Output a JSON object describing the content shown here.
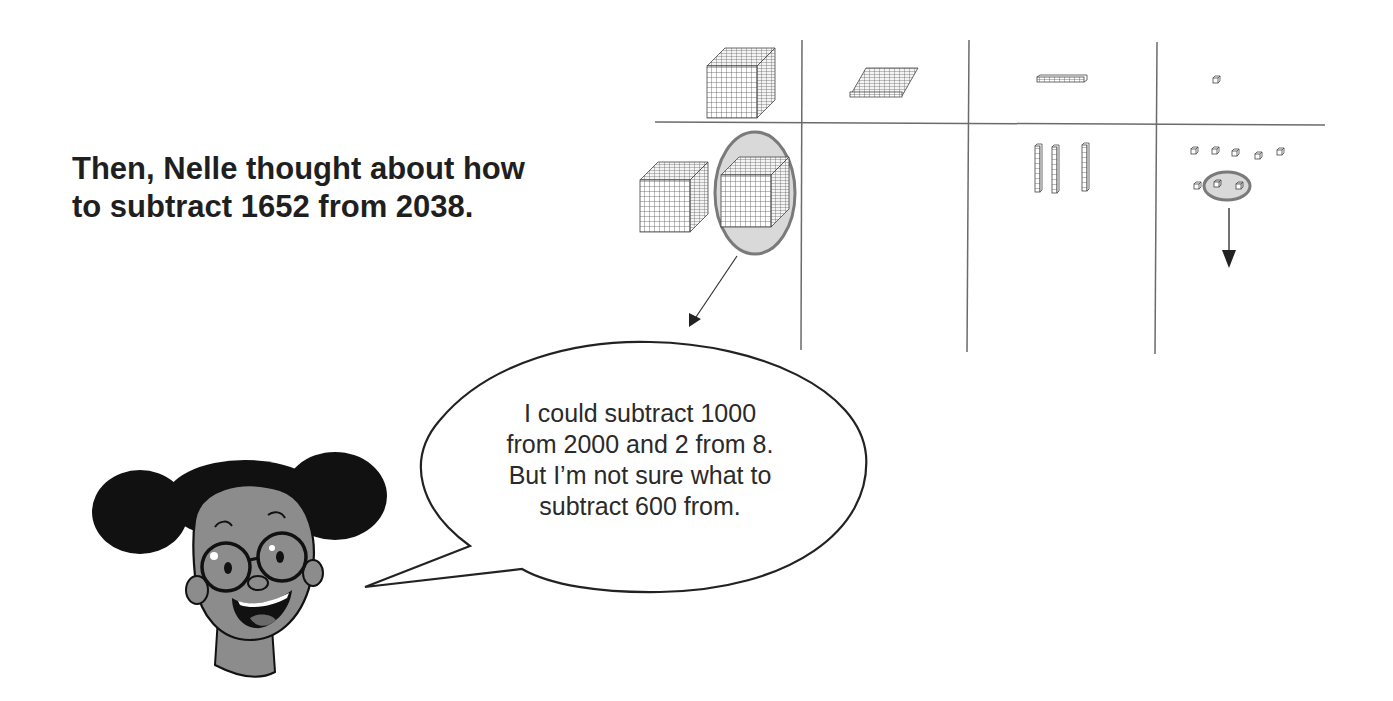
{
  "intro": {
    "lines": [
      "Then, Nelle thought about how",
      "to subtract 1652 from 2038."
    ]
  },
  "speech_bubble": {
    "speaker": "Nelle",
    "lines": [
      "I could subtract 1000",
      "from 2000 and 2 from 8.",
      "But I’m not sure what to",
      "subtract 600 from."
    ]
  },
  "place_value_chart": {
    "columns": [
      "thousands",
      "hundreds",
      "tens",
      "ones"
    ],
    "top_row_key": [
      "thousands-cube",
      "hundreds-flat",
      "tens-rod",
      "ones-unit"
    ],
    "bottom_row_counts": {
      "thousands": 2,
      "hundreds": 0,
      "tens": 3,
      "ones": 8
    },
    "circled": {
      "thousands": 1,
      "ones": 2
    },
    "colors": {
      "line": "#6b6b6b",
      "highlight": "#d9d9d9",
      "highlight_stroke": "#7a7a7a",
      "skin": "#8c8c8c"
    }
  }
}
